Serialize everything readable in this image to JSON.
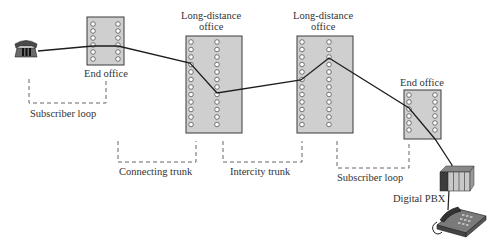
{
  "colors": {
    "office_fill": "#cfcfcf",
    "office_stroke": "#3a3a3a",
    "line": "#1e1e1e",
    "dashed": "#555555",
    "text": "#333333"
  },
  "nodes": {
    "phone_left": {
      "label": ""
    },
    "end_office_1": {
      "label": "End office"
    },
    "long_distance_1": {
      "label_line1": "Long-distance",
      "label_line2": "office"
    },
    "long_distance_2": {
      "label_line1": "Long-distance",
      "label_line2": "office"
    },
    "end_office_2": {
      "label": "End office"
    },
    "pbx": {
      "label": "Digital PBX"
    },
    "phone_right": {
      "label": ""
    }
  },
  "segments": {
    "subscriber_loop_1": "Subscriber loop",
    "connecting_trunk": "Connecting trunk",
    "intercity_trunk": "Intercity trunk",
    "subscriber_loop_2": "Subscriber loop"
  }
}
